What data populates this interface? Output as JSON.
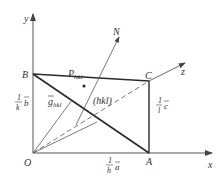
{
  "diagram": {
    "axes": {
      "x": "x",
      "y": "y",
      "z": "z"
    },
    "points": {
      "origin": "O",
      "A": "A",
      "B": "B",
      "C": "C"
    },
    "normal_label": "N",
    "plane_label": "(hkl)",
    "plane_point_label": "P",
    "plane_point_subscript": "hkl",
    "vector_label": "g",
    "vector_subscript": "hkl",
    "intercepts": {
      "a": {
        "num": "1",
        "den": "h",
        "vec": "a"
      },
      "b": {
        "num": "1",
        "den": "k",
        "vec": "b"
      },
      "c": {
        "num": "1",
        "den": "l",
        "vec": "c"
      }
    },
    "colors": {
      "line": "#444444",
      "bold_line": "#2a2a2a",
      "text": "#333333"
    }
  }
}
